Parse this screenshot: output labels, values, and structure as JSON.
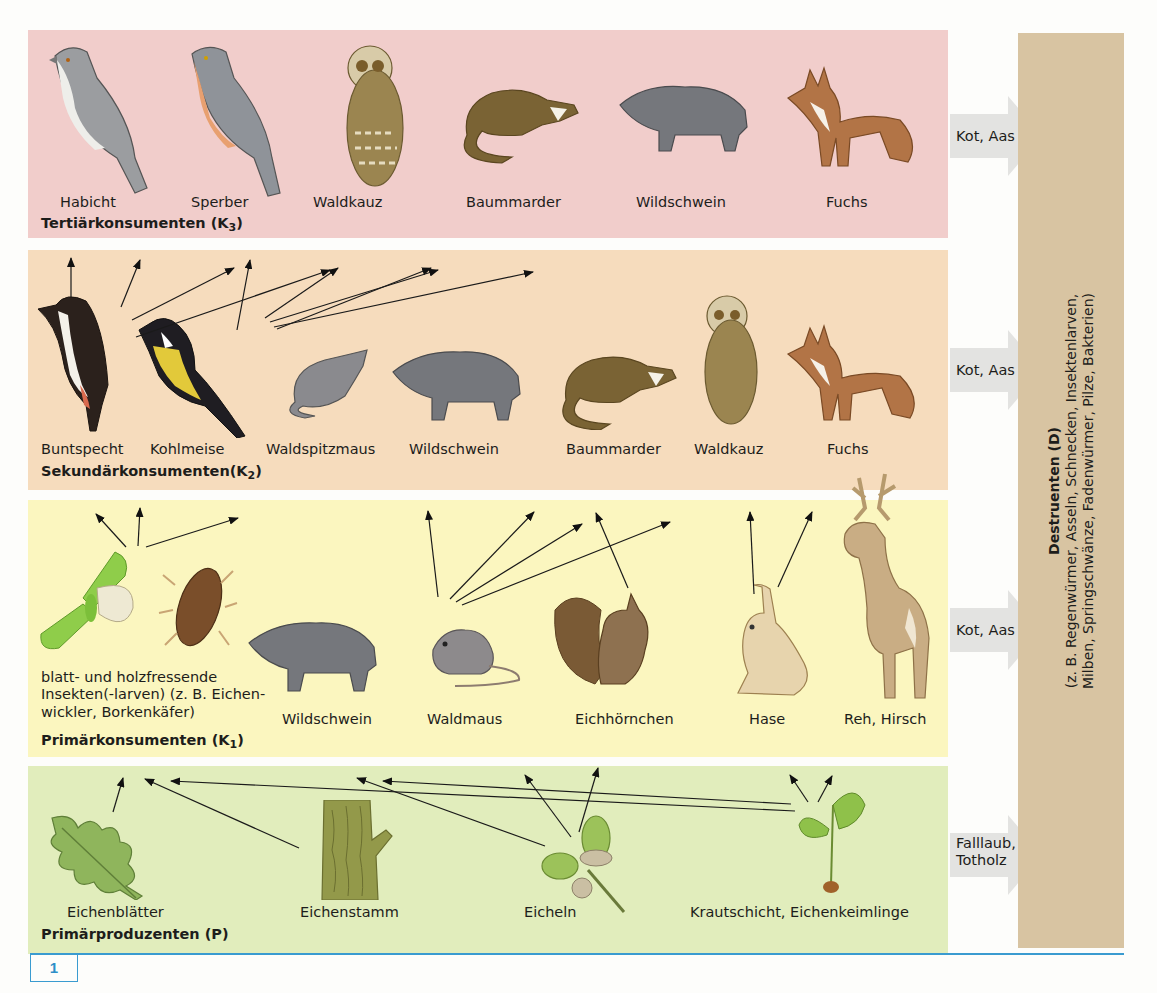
{
  "figure": {
    "number": "1"
  },
  "levels": {
    "k3": {
      "title": "Tertiärkonsumenten (K",
      "subscript": "3",
      "title_close": ")",
      "organisms": [
        "Habicht",
        "Sperber",
        "Waldkauz",
        "Baummarder",
        "Wildschwein",
        "Fuchs"
      ],
      "flow": "Kot, Aas"
    },
    "k2": {
      "title": "Sekundärkonsumenten(K",
      "subscript": "2",
      "title_close": ")",
      "organisms": [
        "Buntspecht",
        "Kohlmeise",
        "Waldspitzmaus",
        "Wildschwein",
        "Baummarder",
        "Waldkauz",
        "Fuchs"
      ],
      "flow": "Kot, Aas"
    },
    "k1": {
      "title": "Primärkonsumenten (K",
      "subscript": "1",
      "title_close": ")",
      "organisms": [
        "blatt- und holzfressende Insekten(-larven)  (z. B. Eichen-wickler, Borkenkäfer)",
        "Wildschwein",
        "Waldmaus",
        "Eichhörnchen",
        "Hase",
        "Reh, Hirsch"
      ],
      "flow": "Kot, Aas"
    },
    "p": {
      "title": "Primärproduzenten (P)",
      "organisms": [
        "Eichenblätter",
        "Eichenstamm",
        "Eicheln",
        "Krautschicht, Eichenkeimlinge"
      ],
      "flow_line1": "Falllaub,",
      "flow_line2": "Totholz"
    }
  },
  "destruenten": {
    "title": "Destruenten (D)",
    "line1": "(z. B. Regenwürmer, Asseln, Schnecken, Insektenlarven,",
    "line2": "Milben, Springschwänze, Fadenwürmer, Pilze, Bakterien)"
  },
  "colors": {
    "k3_band": "#f1cdcb",
    "k2_band": "#f6dcbd",
    "k1_band": "#fbf6bf",
    "p_band": "#e1edbc",
    "destruenten": "#d8c4a2",
    "flow_arrow": "#e3e3e1",
    "rule": "#3a9bd0"
  }
}
